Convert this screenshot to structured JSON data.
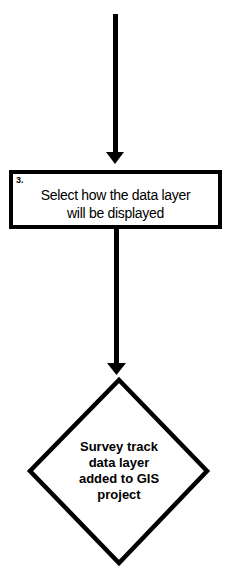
{
  "diagram": {
    "type": "flowchart",
    "colors": {
      "stroke": "#000000",
      "fill": "#ffffff",
      "text": "#000000"
    },
    "nodes": [
      {
        "id": "step-3",
        "shape": "rectangle",
        "number": "3.",
        "lines": [
          "Select how the data layer",
          "will be displayed"
        ]
      },
      {
        "id": "result",
        "shape": "diamond",
        "lines": [
          "Survey track",
          "data layer",
          "added to GIS",
          "project"
        ]
      }
    ],
    "edges": [
      {
        "from": "top-incoming",
        "to": "step-3",
        "direction": "down"
      },
      {
        "from": "step-3",
        "to": "result",
        "direction": "down"
      }
    ]
  }
}
